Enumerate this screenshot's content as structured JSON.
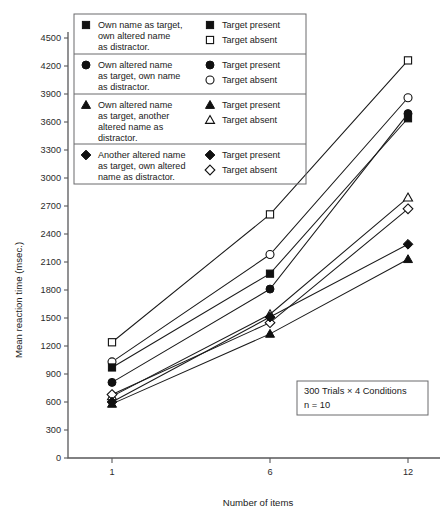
{
  "chart_data": {
    "type": "line",
    "title": "",
    "xlabel": "Number of items",
    "ylabel": "Mean reaction time (msec.)",
    "x": [
      1,
      6,
      12
    ],
    "xtick_labels": [
      "1",
      "6",
      "12"
    ],
    "ylim": [
      0,
      4500
    ],
    "ytick_labels": [
      "0",
      "300",
      "600",
      "900",
      "1200",
      "1500",
      "1800",
      "2100",
      "2400",
      "2700",
      "3000",
      "3300",
      "3600",
      "3900",
      "4200",
      "4500"
    ],
    "ytick_values": [
      0,
      300,
      600,
      900,
      1200,
      1500,
      1800,
      2100,
      2400,
      2700,
      3000,
      3300,
      3600,
      3900,
      4200,
      4500
    ],
    "grid": false,
    "legend_position": "upper-left-inside",
    "series": [
      {
        "name": "Own name as target, own altered name as distractor. — Target absent",
        "marker": "square-open",
        "values": [
          1240,
          2610,
          4260
        ]
      },
      {
        "name": "Own altered name as target, own name as distractor. — Target absent",
        "marker": "circle-open",
        "values": [
          1030,
          2180,
          3860
        ]
      },
      {
        "name": "Own name as target, own altered name as distractor. — Target present",
        "marker": "square-filled",
        "values": [
          970,
          1975,
          3640
        ]
      },
      {
        "name": "Own altered name as target, own name as distractor. — Target present",
        "marker": "circle-filled",
        "values": [
          810,
          1810,
          3690
        ]
      },
      {
        "name": "Own altered name as target, another altered name as distractor. — Target absent",
        "marker": "triangle-open",
        "values": [
          660,
          1540,
          2790
        ]
      },
      {
        "name": "Another altered name as target, own altered name as distractor. — Target absent",
        "marker": "diamond-open",
        "values": [
          680,
          1450,
          2670
        ]
      },
      {
        "name": "Another altered name as target, own altered name as distractor. — Target present",
        "marker": "diamond-filled",
        "values": [
          600,
          1510,
          2290
        ]
      },
      {
        "name": "Own altered name as target, another altered name as distractor. — Target present",
        "marker": "triangle-filled",
        "values": [
          580,
          1330,
          2130
        ]
      }
    ],
    "annotation": {
      "line1": "300 Trials × 4 Conditions",
      "line2": "n = 10"
    }
  },
  "legend": {
    "rows": [
      {
        "condition": [
          "Own name as target,",
          "own altered name",
          "as distractor."
        ],
        "condition_marker": "square-filled",
        "entries": [
          {
            "marker": "square-filled",
            "label": "Target present"
          },
          {
            "marker": "square-open",
            "label": "Target absent"
          }
        ]
      },
      {
        "condition": [
          "Own altered name",
          "as target, own name",
          "as distractor."
        ],
        "condition_marker": "circle-filled",
        "entries": [
          {
            "marker": "circle-filled",
            "label": "Target present"
          },
          {
            "marker": "circle-open",
            "label": "Target absent"
          }
        ]
      },
      {
        "condition": [
          "Own altered name",
          "as target, another",
          "altered name as",
          "distractor."
        ],
        "condition_marker": "triangle-filled",
        "entries": [
          {
            "marker": "triangle-filled",
            "label": "Target present"
          },
          {
            "marker": "triangle-open",
            "label": "Target absent"
          }
        ]
      },
      {
        "condition": [
          "Another altered name",
          "as target, own altered",
          "name as distractor."
        ],
        "condition_marker": "diamond-filled",
        "entries": [
          {
            "marker": "diamond-filled",
            "label": "Target present"
          },
          {
            "marker": "diamond-open",
            "label": "Target absent"
          }
        ]
      }
    ]
  },
  "colors": {
    "ink": "#101010",
    "axis": "#58585a",
    "box": "#6a6a6c",
    "background": "#ffffff"
  }
}
